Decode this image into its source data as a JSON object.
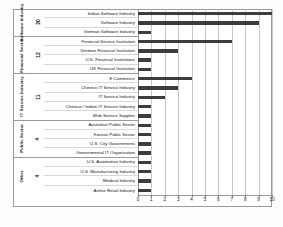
{
  "chart_data": {
    "type": "bar",
    "orientation": "horizontal",
    "title": "",
    "xlabel": "",
    "ylabel": "",
    "xlim": [
      0,
      10
    ],
    "xticks": [
      0,
      1,
      2,
      3,
      4,
      5,
      6,
      7,
      8,
      9,
      10
    ],
    "grid": true,
    "legend": null,
    "bar_color": "#3d3d3d",
    "categories": [
      "Indian Software Industry",
      "Software Industry",
      "German Software Industry",
      "Financial Service Institution",
      "German Financial Institution",
      "U.S. Financial Institutions",
      "UK Financial Institution",
      "E Commerce",
      "Chinese IT Service Industry",
      "IT Service Industry",
      "Chinese / Indian IT Service Industry",
      "Web Service Supplier",
      "Australian Public Sector",
      "Korean Public Sector",
      "U.S. City Governments",
      "Governmental IT Organization",
      "U.S. Automotive Industry",
      "U.S. Manufacturing Industry",
      "Medical Industry",
      "Airline Retail Industry"
    ],
    "values": [
      10,
      9,
      1,
      7,
      3,
      1,
      1,
      4,
      3,
      2,
      1,
      1,
      1,
      1,
      1,
      1,
      1,
      1,
      1,
      1
    ],
    "groups": [
      {
        "name": "Software Industry",
        "count": "20",
        "rows": 3
      },
      {
        "name": "Financial Sector",
        "count": "12",
        "rows": 4
      },
      {
        "name": "IT Service Industry",
        "count": "11",
        "rows": 5
      },
      {
        "name": "Public Sector",
        "count": "4",
        "rows": 4
      },
      {
        "name": "Other",
        "count": "4",
        "rows": 4
      }
    ]
  }
}
